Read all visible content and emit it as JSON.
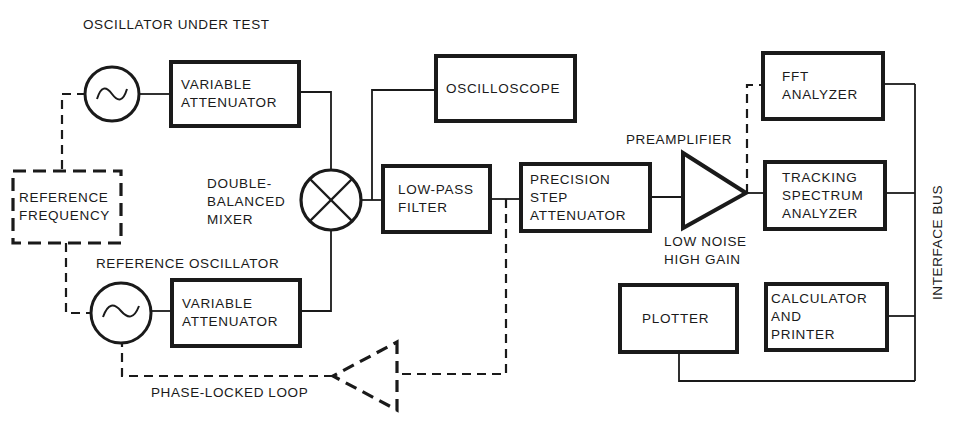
{
  "diagram": {
    "type": "block-diagram",
    "colors": {
      "ink": "#1a1a1a",
      "background": "#ffffff"
    },
    "labels": {
      "oscillator_under_test": "OSCILLATOR UNDER TEST",
      "reference_oscillator": "REFERENCE OSCILLATOR",
      "mixer": [
        "DOUBLE-",
        "BALANCED",
        "MIXER"
      ],
      "preamplifier": "PREAMPLIFIER",
      "preamp_desc": [
        "LOW NOISE",
        "HIGH GAIN"
      ],
      "phase_locked_loop": "PHASE-LOCKED LOOP",
      "interface_bus": "INTERFACE BUS"
    },
    "blocks": {
      "variable_attenuator_top": [
        "VARIABLE",
        "ATTENUATOR"
      ],
      "variable_attenuator_bottom": [
        "VARIABLE",
        "ATTENUATOR"
      ],
      "reference_frequency": [
        "REFERENCE",
        "FREQUENCY"
      ],
      "oscilloscope": [
        "OSCILLOSCOPE"
      ],
      "low_pass_filter": [
        "LOW-PASS",
        "FILTER"
      ],
      "precision_step_attenuator": [
        "PRECISION",
        "STEP",
        "ATTENUATOR"
      ],
      "fft_analyzer": [
        "FFT",
        "ANALYZER"
      ],
      "tracking_spectrum_analyzer": [
        "TRACKING",
        "SPECTRUM",
        "ANALYZER"
      ],
      "plotter": [
        "PLOTTER"
      ],
      "calculator_printer": [
        "CALCULATOR",
        "AND",
        "PRINTER"
      ]
    },
    "symbols": {
      "oscillator_top": "sine-source-icon",
      "oscillator_bottom": "sine-source-icon",
      "mixer": "mixer-x-icon",
      "preamplifier": "amplifier-triangle-icon",
      "pll_amplifier": "dashed-amplifier-triangle-icon"
    },
    "connections": [
      {
        "from": "oscillator_top",
        "to": "variable_attenuator_top",
        "style": "solid"
      },
      {
        "from": "variable_attenuator_top",
        "to": "mixer",
        "style": "solid"
      },
      {
        "from": "oscillator_bottom",
        "to": "variable_attenuator_bottom",
        "style": "solid"
      },
      {
        "from": "variable_attenuator_bottom",
        "to": "mixer",
        "style": "solid"
      },
      {
        "from": "mixer",
        "to": "low_pass_filter",
        "style": "solid"
      },
      {
        "from": "mixer",
        "to": "oscilloscope",
        "style": "solid"
      },
      {
        "from": "low_pass_filter",
        "to": "precision_step_attenuator",
        "style": "solid"
      },
      {
        "from": "precision_step_attenuator",
        "to": "preamplifier",
        "style": "solid"
      },
      {
        "from": "preamplifier",
        "to": "tracking_spectrum_analyzer",
        "style": "solid"
      },
      {
        "from": "preamplifier",
        "to": "fft_analyzer",
        "style": "dashed"
      },
      {
        "from": "low_pass_filter",
        "to": "pll_amplifier",
        "style": "dashed"
      },
      {
        "from": "pll_amplifier",
        "to": "oscillator_bottom",
        "style": "dashed"
      },
      {
        "from": "reference_frequency",
        "to": "oscillator_top",
        "style": "dashed"
      },
      {
        "from": "reference_frequency",
        "to": "oscillator_bottom",
        "style": "dashed"
      },
      {
        "from": "fft_analyzer",
        "to": "interface_bus",
        "style": "solid"
      },
      {
        "from": "tracking_spectrum_analyzer",
        "to": "interface_bus",
        "style": "solid"
      },
      {
        "from": "calculator_printer",
        "to": "interface_bus",
        "style": "solid"
      },
      {
        "from": "plotter",
        "to": "interface_bus",
        "style": "solid"
      }
    ]
  }
}
